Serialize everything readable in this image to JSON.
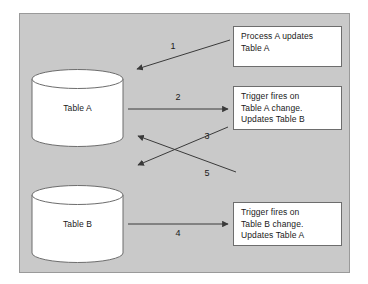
{
  "diagram": {
    "panel": {
      "background_color": "#c9c9c9",
      "border_color": "#9a9a9a"
    },
    "stroke_color": "#3a3a3a",
    "shape_fill": "#ffffff",
    "shape_stroke": "#6d6d6d",
    "tables": [
      {
        "id": "table-a",
        "label": "Table A"
      },
      {
        "id": "table-b",
        "label": "Table B"
      }
    ],
    "boxes": [
      {
        "id": "process-a-updates-table-a",
        "lines": [
          "Process A updates",
          "Table A"
        ]
      },
      {
        "id": "trigger-table-a",
        "lines": [
          "Trigger fires on",
          "Table A change.",
          "Updates Table B"
        ]
      },
      {
        "id": "trigger-table-b",
        "lines": [
          "Trigger fires on",
          "Table B change.",
          "Updates Table A"
        ]
      }
    ],
    "arrows": [
      {
        "id": "arrow-1",
        "number": "1",
        "from": "process-a-updates-table-a",
        "to": "table-a"
      },
      {
        "id": "arrow-2",
        "number": "2",
        "from": "table-a",
        "to": "trigger-table-a"
      },
      {
        "id": "arrow-3",
        "number": "3",
        "from": "trigger-table-a",
        "to": "table-b"
      },
      {
        "id": "arrow-4",
        "number": "4",
        "from": "table-b",
        "to": "trigger-table-b"
      },
      {
        "id": "arrow-5",
        "number": "5",
        "from": "trigger-table-b",
        "to": "table-a"
      }
    ]
  }
}
